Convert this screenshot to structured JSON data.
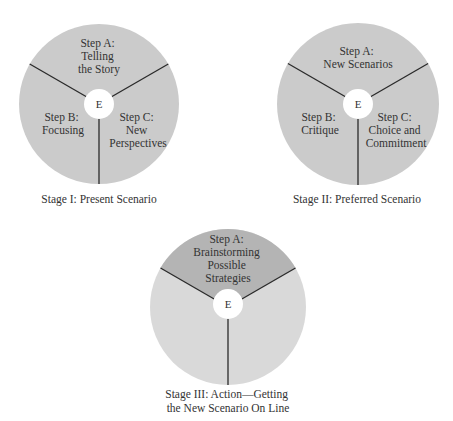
{
  "center_label": "E",
  "colors": {
    "disc": "#cbcbcb",
    "disc_light": "#d9d9d9",
    "highlight_sector": "#b4b4b4",
    "divider": "#2a2a2a",
    "hub": "#ffffff",
    "text": "#333333"
  },
  "stages": [
    {
      "caption": [
        "Stage I: Present Scenario"
      ],
      "steps": [
        {
          "lines": [
            "Step A:",
            "Telling",
            "the Story"
          ]
        },
        {
          "lines": [
            "Step B:",
            "Focusing"
          ]
        },
        {
          "lines": [
            "Step C:",
            "New",
            "Perspectives"
          ]
        }
      ]
    },
    {
      "caption": [
        "Stage II: Preferred Scenario"
      ],
      "steps": [
        {
          "lines": [
            "Step A:",
            "New Scenarios"
          ]
        },
        {
          "lines": [
            "Step B:",
            "Critique"
          ]
        },
        {
          "lines": [
            "Step C:",
            "Choice and",
            "Commitment"
          ]
        }
      ]
    },
    {
      "caption": [
        "Stage III: Action—Getting",
        "the New Scenario On Line"
      ],
      "steps": [
        {
          "lines": [
            "Step A:",
            "Brainstorming",
            "Possible",
            "Strategies"
          ]
        }
      ]
    }
  ]
}
